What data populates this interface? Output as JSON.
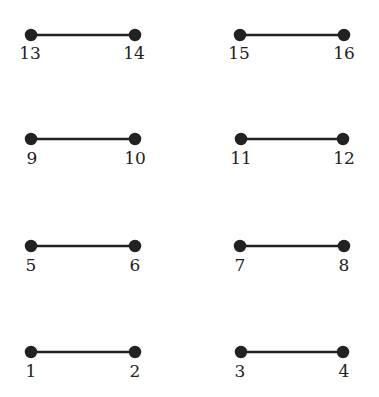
{
  "diagram": {
    "edges": [
      {
        "from": "13",
        "to": "14"
      },
      {
        "from": "15",
        "to": "16"
      },
      {
        "from": "9",
        "to": "10"
      },
      {
        "from": "11",
        "to": "12"
      },
      {
        "from": "5",
        "to": "6"
      },
      {
        "from": "7",
        "to": "8"
      },
      {
        "from": "1",
        "to": "2"
      },
      {
        "from": "3",
        "to": "4"
      }
    ],
    "nodes": {
      "n13": "13",
      "n14": "14",
      "n15": "15",
      "n16": "16",
      "n9": "9",
      "n10": "10",
      "n11": "11",
      "n12": "12",
      "n5": "5",
      "n6": "6",
      "n7": "7",
      "n8": "8",
      "n1": "1",
      "n2": "2",
      "n3": "3",
      "n4": "4"
    },
    "color": "#222222"
  }
}
